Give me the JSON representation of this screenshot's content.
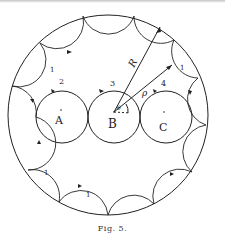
{
  "figure": {
    "caption": "Fig. 5.",
    "labels": {
      "A": "A",
      "B": "B",
      "C": "C",
      "R": "R",
      "rho": "ρ",
      "theta": "θ",
      "n2": "2",
      "n3": "3",
      "n4": "4",
      "one_left_top": "1",
      "one_right_top": "1",
      "one_left_bottom": "1",
      "one_bottom": "1"
    },
    "colors": {
      "line": "#222222",
      "background": "#ffffff"
    }
  }
}
